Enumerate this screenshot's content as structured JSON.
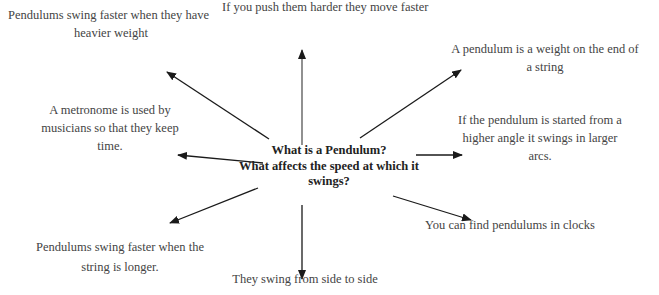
{
  "diagram": {
    "type": "spider-diagram",
    "center": {
      "lines": [
        "What is a Pendulum?",
        "What affects the speed at which it",
        "swings?"
      ]
    },
    "nodes": [
      {
        "id": "push-harder",
        "text": "If you push them harder they move faster"
      },
      {
        "id": "heavier-weight",
        "lines": [
          "Pendulums swing faster when they have",
          "heavier weight"
        ]
      },
      {
        "id": "definition",
        "lines": [
          "A pendulum is a weight on the end of",
          "a string"
        ]
      },
      {
        "id": "metronome",
        "lines": [
          "A metronome is used by",
          "musicians so that they keep",
          "time."
        ]
      },
      {
        "id": "higher-angle",
        "lines": [
          "If the pendulum is started from a",
          "higher angle it swings in larger",
          "arcs."
        ]
      },
      {
        "id": "longer-string",
        "lines": [
          "Pendulums swing faster when the",
          "string is longer."
        ]
      },
      {
        "id": "clocks",
        "text": "You can find pendulums in clocks"
      },
      {
        "id": "side-to-side",
        "text": "They swing from side to side"
      }
    ],
    "arrow_color": "#1a1a1a",
    "text_color": "#444444"
  }
}
